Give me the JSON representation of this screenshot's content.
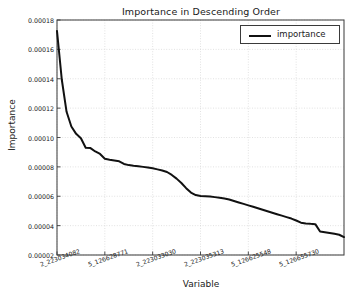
{
  "chart_data": {
    "type": "line",
    "title": "Importance in Descending Order",
    "xlabel": "Variable",
    "ylabel": "Importance",
    "grid": true,
    "legend": {
      "position": "top-right",
      "entries": [
        {
          "name": "importance",
          "color": "#111111"
        }
      ]
    },
    "ylim": [
      2e-05,
      0.00018
    ],
    "yticks": [
      "0.00002",
      "0.00004",
      "0.00006",
      "0.00008",
      "0.00010",
      "0.00012",
      "0.00014",
      "0.00016",
      "0.00018"
    ],
    "ytick_values": [
      2e-05,
      4e-05,
      6e-05,
      8e-05,
      0.0001,
      0.00012,
      0.00014,
      0.00016,
      0.00018
    ],
    "xticks": [
      "2_223034082",
      "5_126628771",
      "2_223033030",
      "2_223035313",
      "5_126625548",
      "5_126655730"
    ],
    "xtick_positions": [
      0,
      10,
      20,
      30,
      40,
      50
    ],
    "xlim": [
      0,
      60
    ],
    "series": [
      {
        "name": "importance",
        "color": "#111111",
        "x": [
          0,
          1,
          2,
          3,
          4,
          5,
          6,
          7,
          8,
          9,
          10,
          11,
          12,
          13,
          14,
          15,
          16,
          17,
          18,
          19,
          20,
          21,
          22,
          23,
          24,
          25,
          26,
          27,
          28,
          29,
          30,
          31,
          32,
          33,
          34,
          35,
          36,
          37,
          38,
          39,
          40,
          41,
          42,
          43,
          44,
          45,
          46,
          47,
          48,
          49,
          50,
          51,
          52,
          53,
          54,
          55,
          56,
          57,
          58,
          59,
          60
        ],
        "values": [
          0.0001725,
          0.0001395,
          0.0001175,
          0.0001075,
          0.0001025,
          9.95e-05,
          9.3e-05,
          9.28e-05,
          9.05e-05,
          8.88e-05,
          8.55e-05,
          8.48e-05,
          8.43e-05,
          8.38e-05,
          8.2e-05,
          8.12e-05,
          8.08e-05,
          8.05e-05,
          8e-05,
          7.95e-05,
          7.9e-05,
          7.83e-05,
          7.75e-05,
          7.65e-05,
          7.45e-05,
          7.2e-05,
          6.9e-05,
          6.55e-05,
          6.25e-05,
          6.08e-05,
          6.02e-05,
          6e-05,
          5.98e-05,
          5.94e-05,
          5.9e-05,
          5.85e-05,
          5.78e-05,
          5.68e-05,
          5.58e-05,
          5.48e-05,
          5.38e-05,
          5.28e-05,
          5.18e-05,
          5.08e-05,
          4.98e-05,
          4.88e-05,
          4.78e-05,
          4.68e-05,
          4.58e-05,
          4.48e-05,
          4.35e-05,
          4.2e-05,
          4.15e-05,
          4.12e-05,
          4.1e-05,
          3.6e-05,
          3.55e-05,
          3.5e-05,
          3.44e-05,
          3.38e-05,
          3.22e-05
        ]
      }
    ]
  }
}
